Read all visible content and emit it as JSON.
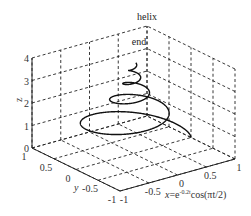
{
  "chart_data": {
    "type": "line",
    "subtype": "3d-line",
    "title": "helix",
    "xlabel": "x=e^{-0.2t}cos(πt/2)",
    "ylabel": "y",
    "zlabel": "z",
    "xlim": [
      -1,
      1
    ],
    "ylim": [
      -1,
      1
    ],
    "zlim": [
      0,
      4
    ],
    "xticks": [
      "-1",
      "-0.5",
      "0",
      "0.5",
      "1"
    ],
    "yticks": [
      "-1",
      "-0.5",
      "0",
      "0.5",
      "1"
    ],
    "zticks": [
      "0",
      "1",
      "2",
      "3",
      "4"
    ],
    "grid": true,
    "annotations": [
      {
        "text": "end",
        "at": "curve end (top)"
      }
    ],
    "series": [
      {
        "name": "helix",
        "x_expr": "exp(-0.2*t)*cos(pi*t/2)",
        "y_expr": "exp(-0.2*t)*sin(pi*t/2)",
        "z_expr": "sqrt(t)",
        "t_range": [
          0,
          16
        ],
        "color": "#111111"
      }
    ]
  },
  "labels": {
    "title": "helix",
    "end": "end",
    "zaxis": "z",
    "yaxis": "y",
    "xaxis_main": "x=e",
    "xaxis_sup": "-0.2t",
    "xaxis_tail": "cos(πt/2)"
  }
}
